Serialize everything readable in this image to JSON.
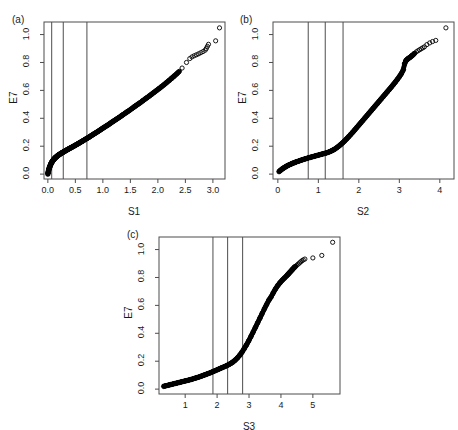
{
  "figure": {
    "background": "#ffffff",
    "axis_color": "#4d4d4d",
    "point_color": "#000000",
    "rule_color": "#4d4d4d"
  },
  "panels": [
    {
      "tag": "(a)",
      "xlabel": "S1",
      "ylabel": "E7",
      "xticks": [
        "0.0",
        "0.5",
        "1.0",
        "1.5",
        "2.0",
        "2.5",
        "3.0"
      ],
      "xtickvals": [
        0.0,
        0.5,
        1.0,
        1.5,
        2.0,
        2.5,
        3.0
      ],
      "yticks": [
        "0.0",
        "0.2",
        "0.4",
        "0.6",
        "0.8",
        "1.0"
      ],
      "ytickvals": [
        0.0,
        0.2,
        0.4,
        0.6,
        0.8,
        1.0
      ],
      "xlim": [
        -0.07,
        3.22
      ],
      "ylim": [
        -0.035,
        1.09
      ],
      "vlines": [
        0.07,
        0.28,
        0.71
      ]
    },
    {
      "tag": "(b)",
      "xlabel": "S2",
      "ylabel": "E7",
      "xticks": [
        "0",
        "1",
        "2",
        "3",
        "4"
      ],
      "xtickvals": [
        0,
        1,
        2,
        3,
        4
      ],
      "yticks": [
        "0.0",
        "0.2",
        "0.4",
        "0.6",
        "0.8",
        "1.0"
      ],
      "ytickvals": [
        0.0,
        0.2,
        0.4,
        0.6,
        0.8,
        1.0
      ],
      "xlim": [
        -0.12,
        4.35
      ],
      "ylim": [
        -0.035,
        1.09
      ],
      "vlines": [
        0.75,
        1.17,
        1.61
      ]
    },
    {
      "tag": "(c)",
      "xlabel": "S3",
      "ylabel": "E7",
      "xticks": [
        "1",
        "2",
        "3",
        "4",
        "5"
      ],
      "xtickvals": [
        1,
        2,
        3,
        4,
        5
      ],
      "yticks": [
        "0.0",
        "0.2",
        "0.4",
        "0.6",
        "0.8",
        "1.0"
      ],
      "ytickvals": [
        0.0,
        0.2,
        0.4,
        0.6,
        0.8,
        1.0
      ],
      "xlim": [
        0.18,
        5.85
      ],
      "ylim": [
        -0.035,
        1.09
      ],
      "vlines": [
        1.87,
        2.33,
        2.8
      ]
    }
  ],
  "chart_data": [
    {
      "type": "scatter",
      "title": "(a)",
      "xlabel": "S1",
      "ylabel": "E7",
      "xlim": [
        -0.07,
        3.22
      ],
      "ylim": [
        -0.035,
        1.09
      ],
      "grid": false,
      "legend": false,
      "annotations": [
        {
          "type": "vline",
          "x": 0.07
        },
        {
          "type": "vline",
          "x": 0.28
        },
        {
          "type": "vline",
          "x": 0.71
        }
      ],
      "series": [
        {
          "name": "E7 vs S1",
          "marker": "open-circle",
          "x": [
            0.0,
            0.005,
            0.01,
            0.015,
            0.02,
            0.025,
            0.03,
            0.035,
            0.04,
            0.045,
            0.05,
            0.056,
            0.062,
            0.068,
            0.074,
            0.08,
            0.088,
            0.096,
            0.104,
            0.112,
            0.121,
            0.13,
            0.14,
            0.15,
            0.161,
            0.172,
            0.184,
            0.196,
            0.209,
            0.222,
            0.236,
            0.25,
            0.265,
            0.28,
            0.296,
            0.312,
            0.329,
            0.346,
            0.364,
            0.382,
            0.401,
            0.42,
            0.44,
            0.46,
            0.481,
            0.502,
            0.524,
            0.546,
            0.569,
            0.592,
            0.616,
            0.64,
            0.665,
            0.69,
            0.716,
            0.742,
            0.769,
            0.796,
            0.824,
            0.852,
            0.881,
            0.91,
            0.94,
            0.97,
            1.001,
            1.032,
            1.064,
            1.096,
            1.129,
            1.162,
            1.196,
            1.23,
            1.265,
            1.3,
            1.336,
            1.372,
            1.409,
            1.446,
            1.484,
            1.522,
            1.561,
            1.6,
            1.64,
            1.68,
            1.721,
            1.762,
            1.804,
            1.846,
            1.889,
            1.932,
            1.976,
            2.02,
            2.065,
            2.11,
            2.156,
            2.202,
            2.249,
            2.296,
            2.344,
            2.392,
            2.44,
            2.52,
            2.58,
            2.62,
            2.66,
            2.7,
            2.74,
            2.78,
            2.82,
            2.86,
            2.88,
            2.9,
            2.92,
            3.05,
            3.12
          ],
          "y": [
            0.0,
            0.012,
            0.021,
            0.029,
            0.036,
            0.042,
            0.048,
            0.053,
            0.058,
            0.063,
            0.068,
            0.073,
            0.078,
            0.082,
            0.086,
            0.09,
            0.095,
            0.099,
            0.103,
            0.107,
            0.111,
            0.115,
            0.119,
            0.122,
            0.126,
            0.13,
            0.133,
            0.137,
            0.14,
            0.144,
            0.147,
            0.151,
            0.154,
            0.158,
            0.161,
            0.165,
            0.169,
            0.173,
            0.177,
            0.181,
            0.185,
            0.189,
            0.193,
            0.198,
            0.202,
            0.207,
            0.212,
            0.217,
            0.222,
            0.228,
            0.233,
            0.239,
            0.245,
            0.251,
            0.257,
            0.263,
            0.27,
            0.277,
            0.284,
            0.291,
            0.298,
            0.305,
            0.313,
            0.321,
            0.329,
            0.337,
            0.345,
            0.353,
            0.362,
            0.371,
            0.38,
            0.389,
            0.398,
            0.407,
            0.417,
            0.427,
            0.437,
            0.447,
            0.457,
            0.468,
            0.479,
            0.49,
            0.501,
            0.512,
            0.524,
            0.536,
            0.548,
            0.56,
            0.573,
            0.586,
            0.599,
            0.612,
            0.626,
            0.64,
            0.655,
            0.67,
            0.686,
            0.702,
            0.719,
            0.737,
            0.76,
            0.8,
            0.828,
            0.84,
            0.848,
            0.855,
            0.862,
            0.87,
            0.878,
            0.888,
            0.9,
            0.915,
            0.93,
            0.955,
            1.048
          ]
        }
      ]
    },
    {
      "type": "scatter",
      "title": "(b)",
      "xlabel": "S2",
      "ylabel": "E7",
      "xlim": [
        -0.12,
        4.35
      ],
      "ylim": [
        -0.035,
        1.09
      ],
      "grid": false,
      "legend": false,
      "annotations": [
        {
          "type": "vline",
          "x": 0.75
        },
        {
          "type": "vline",
          "x": 1.17
        },
        {
          "type": "vline",
          "x": 1.61
        }
      ],
      "series": [
        {
          "name": "E7 vs S2",
          "marker": "open-circle",
          "x": [
            0.03,
            0.07,
            0.11,
            0.15,
            0.19,
            0.23,
            0.27,
            0.32,
            0.36,
            0.41,
            0.45,
            0.5,
            0.55,
            0.6,
            0.65,
            0.7,
            0.75,
            0.8,
            0.85,
            0.9,
            0.95,
            1.0,
            1.05,
            1.1,
            1.15,
            1.2,
            1.25,
            1.3,
            1.35,
            1.4,
            1.45,
            1.5,
            1.55,
            1.6,
            1.65,
            1.7,
            1.75,
            1.8,
            1.85,
            1.9,
            1.95,
            2.0,
            2.05,
            2.1,
            2.15,
            2.2,
            2.25,
            2.3,
            2.35,
            2.4,
            2.45,
            2.5,
            2.55,
            2.6,
            2.65,
            2.7,
            2.75,
            2.8,
            2.85,
            2.9,
            2.95,
            3.0,
            3.05,
            3.1,
            3.13,
            3.16,
            3.19,
            3.22,
            3.26,
            3.3,
            3.34,
            3.38,
            3.42,
            3.46,
            3.5,
            3.54,
            3.58,
            3.62,
            3.68,
            3.75,
            3.82,
            3.9,
            4.15
          ],
          "y": [
            0.018,
            0.028,
            0.037,
            0.045,
            0.052,
            0.059,
            0.065,
            0.071,
            0.077,
            0.082,
            0.087,
            0.092,
            0.097,
            0.102,
            0.107,
            0.111,
            0.116,
            0.12,
            0.124,
            0.128,
            0.132,
            0.136,
            0.14,
            0.144,
            0.148,
            0.152,
            0.157,
            0.163,
            0.17,
            0.178,
            0.188,
            0.199,
            0.211,
            0.224,
            0.238,
            0.253,
            0.268,
            0.284,
            0.3,
            0.317,
            0.334,
            0.351,
            0.368,
            0.385,
            0.402,
            0.419,
            0.436,
            0.453,
            0.47,
            0.487,
            0.504,
            0.521,
            0.538,
            0.555,
            0.572,
            0.589,
            0.606,
            0.623,
            0.641,
            0.659,
            0.678,
            0.698,
            0.72,
            0.748,
            0.79,
            0.812,
            0.82,
            0.828,
            0.836,
            0.845,
            0.855,
            0.866,
            0.876,
            0.884,
            0.891,
            0.898,
            0.905,
            0.912,
            0.928,
            0.94,
            0.95,
            0.958,
            1.048
          ]
        }
      ]
    },
    {
      "type": "scatter",
      "title": "(c)",
      "xlabel": "S3",
      "ylabel": "E7",
      "xlim": [
        0.18,
        5.85
      ],
      "ylim": [
        -0.035,
        1.09
      ],
      "grid": false,
      "legend": false,
      "annotations": [
        {
          "type": "vline",
          "x": 1.87
        },
        {
          "type": "vline",
          "x": 2.33
        },
        {
          "type": "vline",
          "x": 2.8
        }
      ],
      "series": [
        {
          "name": "E7 vs S3",
          "marker": "open-circle",
          "x": [
            0.33,
            0.4,
            0.47,
            0.54,
            0.61,
            0.68,
            0.75,
            0.82,
            0.89,
            0.96,
            1.03,
            1.1,
            1.17,
            1.24,
            1.31,
            1.38,
            1.45,
            1.52,
            1.59,
            1.66,
            1.73,
            1.8,
            1.87,
            1.94,
            2.01,
            2.08,
            2.15,
            2.22,
            2.29,
            2.36,
            2.43,
            2.5,
            2.57,
            2.64,
            2.71,
            2.78,
            2.85,
            2.92,
            2.99,
            3.06,
            3.13,
            3.2,
            3.27,
            3.34,
            3.41,
            3.48,
            3.55,
            3.62,
            3.69,
            3.76,
            3.83,
            3.9,
            3.97,
            4.04,
            4.11,
            4.18,
            4.22,
            4.26,
            4.3,
            4.34,
            4.38,
            4.42,
            4.46,
            4.5,
            4.54,
            4.58,
            4.62,
            4.66,
            4.7,
            4.75,
            5.0,
            5.28,
            5.62
          ],
          "y": [
            0.02,
            0.024,
            0.028,
            0.032,
            0.036,
            0.04,
            0.044,
            0.048,
            0.052,
            0.056,
            0.06,
            0.064,
            0.068,
            0.073,
            0.078,
            0.083,
            0.088,
            0.094,
            0.1,
            0.106,
            0.112,
            0.118,
            0.125,
            0.132,
            0.139,
            0.146,
            0.153,
            0.16,
            0.167,
            0.175,
            0.184,
            0.195,
            0.208,
            0.224,
            0.243,
            0.265,
            0.29,
            0.317,
            0.346,
            0.377,
            0.409,
            0.442,
            0.475,
            0.508,
            0.541,
            0.574,
            0.606,
            0.637,
            0.66,
            0.69,
            0.718,
            0.742,
            0.762,
            0.78,
            0.796,
            0.812,
            0.822,
            0.832,
            0.842,
            0.852,
            0.862,
            0.872,
            0.88,
            0.888,
            0.896,
            0.904,
            0.912,
            0.92,
            0.926,
            0.932,
            0.94,
            0.958,
            1.052
          ]
        }
      ]
    }
  ]
}
